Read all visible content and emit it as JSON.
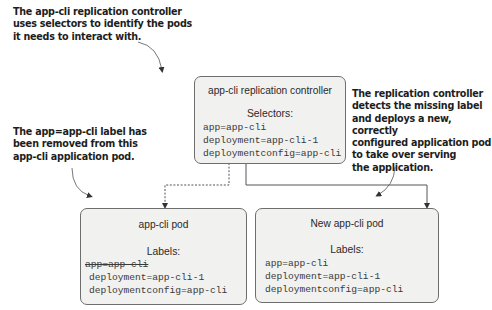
{
  "annotations": {
    "top_left": [
      "The app-cli replication controller",
      "uses selectors to identify the pods",
      "it needs to interact with."
    ],
    "middle_left": [
      "The app=app-cli label has",
      "been removed from this",
      "app-cli application pod."
    ],
    "right": [
      "The replication controller",
      "detects the missing label",
      "and deploys a new, correctly",
      "configured application pod",
      "to take over serving",
      "the application."
    ]
  },
  "controller": {
    "title": "app-cli replication controller",
    "section_label": "Selectors:",
    "lines": [
      "app=app-cli",
      "deployment=app-cli-1",
      "deploymentconfig=app-cli"
    ]
  },
  "old_pod": {
    "title": "app-cli pod",
    "section_label": "Labels:",
    "removed_line": "app=app-cli",
    "lines": [
      "deployment=app-cli-1",
      "deploymentconfig=app-cli"
    ]
  },
  "new_pod": {
    "title": "New app-cli pod",
    "section_label": "Labels:",
    "lines": [
      "app=app-cli",
      "deployment=app-cli-1",
      "deploymentconfig=app-cli"
    ]
  },
  "connectors": {
    "to_old_pod": "dashed",
    "to_new_pod": "solid"
  },
  "colors": {
    "box_fill": "#f1f1f0",
    "box_border": "#6e6e6e",
    "text": "#1d1d1d"
  }
}
